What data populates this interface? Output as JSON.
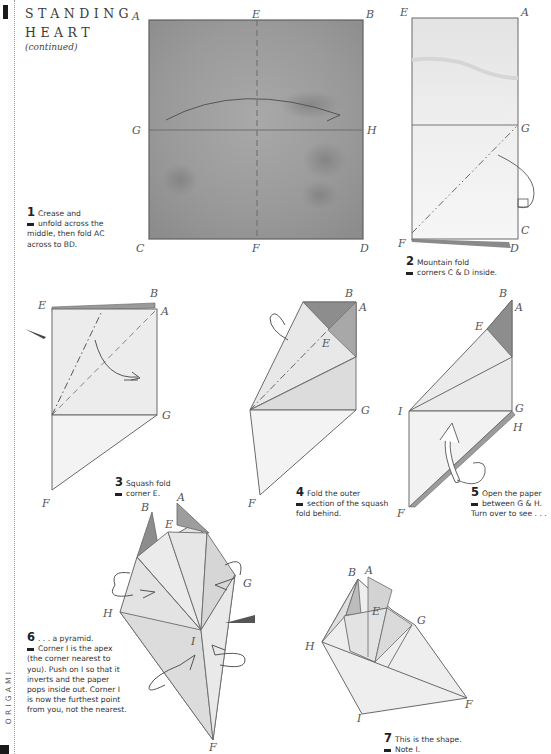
{
  "page": {
    "title_line1": "STANDING",
    "title_line2": "HEART",
    "subtitle": "(continued)",
    "side_label": "ORIGAMI"
  },
  "steps": [
    {
      "number": "1",
      "text_first": "Crease and",
      "text_rest": "unfold across the middle, then fold AC across to BD."
    },
    {
      "number": "2",
      "text_first": "Mountain fold",
      "text_rest": "corners C & D inside."
    },
    {
      "number": "3",
      "text_first": "Squash fold",
      "text_rest": "corner E."
    },
    {
      "number": "4",
      "text_first": "Fold the outer",
      "text_rest": "section of the squash fold behind."
    },
    {
      "number": "5",
      "text_first": "Open the paper",
      "text_rest": "between G & H. Turn over to see . . ."
    },
    {
      "number": "6",
      "text_first": ". . . a pyramid.",
      "text_rest": "Corner I is the apex (the corner nearest to you). Push on I so that it inverts and the paper pops inside out. Corner I is now the furthest point from you, not the nearest."
    },
    {
      "number": "7",
      "text_first": "This is the shape.",
      "text_rest": "Note I."
    }
  ],
  "diagrams": {
    "d1": {
      "labels": [
        "A",
        "E",
        "B",
        "G",
        "H",
        "C",
        "F",
        "D"
      ]
    },
    "d2": {
      "labels": [
        "E",
        "A",
        "G",
        "C",
        "F",
        "D"
      ]
    },
    "d3": {
      "labels": [
        "E",
        "B",
        "A",
        "G",
        "F"
      ]
    },
    "d4": {
      "labels": [
        "B",
        "A",
        "E",
        "G",
        "F"
      ]
    },
    "d5": {
      "labels": [
        "B",
        "A",
        "E",
        "I",
        "G",
        "H",
        "F"
      ]
    },
    "d6": {
      "labels": [
        "B",
        "A",
        "E",
        "G",
        "H",
        "I",
        "F"
      ]
    },
    "d7": {
      "labels": [
        "B",
        "A",
        "E",
        "G",
        "H",
        "I",
        "F"
      ]
    }
  },
  "colors": {
    "paper_wash": "#9c9c9c",
    "paper_light": "#ececec",
    "fold_shadow": "#8a8a8a",
    "line": "#6a6a6a",
    "text": "#2a2a2a"
  }
}
